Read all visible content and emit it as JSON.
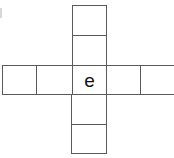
{
  "diagram": {
    "type": "cross-shaped grid (cube net / letter puzzle)",
    "line_color": "#5a5a5a",
    "cells": [
      {
        "id": "top-1",
        "row": 0,
        "col": 2,
        "text": ""
      },
      {
        "id": "top-2",
        "row": 1,
        "col": 2,
        "text": ""
      },
      {
        "id": "mid-1",
        "row": 2,
        "col": 0,
        "text": ""
      },
      {
        "id": "mid-2",
        "row": 2,
        "col": 1,
        "text": ""
      },
      {
        "id": "center",
        "row": 2,
        "col": 2,
        "text": "e"
      },
      {
        "id": "mid-4",
        "row": 2,
        "col": 3,
        "text": ""
      },
      {
        "id": "mid-5",
        "row": 2,
        "col": 4,
        "text": ""
      },
      {
        "id": "bottom-1",
        "row": 3,
        "col": 2,
        "text": ""
      },
      {
        "id": "bottom-2",
        "row": 4,
        "col": 2,
        "text": ""
      }
    ]
  }
}
